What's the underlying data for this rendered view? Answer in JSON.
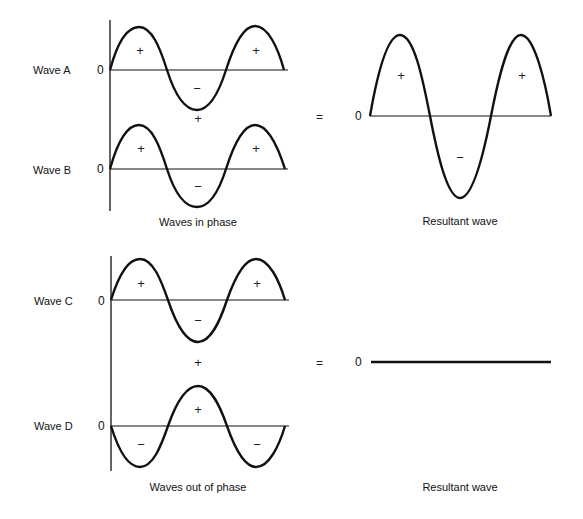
{
  "figure": {
    "top_section": {
      "caption": "Waves in phase",
      "waves": [
        {
          "label": "Wave A",
          "zero": "0",
          "signs": [
            "+",
            "−",
            "+"
          ]
        },
        {
          "label": "Wave B",
          "zero": "0",
          "signs": [
            "+",
            "−",
            "+"
          ]
        }
      ],
      "plus_between": "+",
      "equals": "=",
      "resultant": {
        "zero": "0",
        "signs": [
          "+",
          "−",
          "+"
        ],
        "caption": "Resultant wave"
      }
    },
    "bottom_section": {
      "caption": "Waves out of phase",
      "waves": [
        {
          "label": "Wave C",
          "zero": "0",
          "signs": [
            "+",
            "−",
            "+"
          ]
        },
        {
          "label": "Wave D",
          "zero": "0",
          "signs": [
            "−",
            "+",
            "−"
          ]
        }
      ],
      "plus_between": "+",
      "equals": "=",
      "resultant": {
        "zero": "0",
        "caption": "Resultant wave"
      }
    }
  },
  "colors": {
    "stroke": "#111111",
    "background": "#ffffff"
  }
}
